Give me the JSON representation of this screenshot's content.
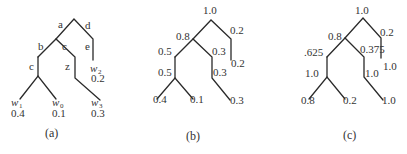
{
  "figure": {
    "panels": [
      {
        "caption": "(a)",
        "edge_labels": {
          "a": "a",
          "b": "b",
          "c_left": "c",
          "c_right": "c",
          "d": "d",
          "e": "e",
          "z": "z"
        },
        "leaves": [
          {
            "symbol": "w",
            "sub": "1",
            "value": "0.4"
          },
          {
            "symbol": "w",
            "sub": "0",
            "value": "0.1"
          },
          {
            "symbol": "w",
            "sub": "3",
            "value": "0.3"
          },
          {
            "symbol": "w",
            "sub": "2",
            "value": "0.2"
          }
        ]
      },
      {
        "caption": "(b)",
        "root": "1.0",
        "left_top": "0.8",
        "right_top": "0.2",
        "ll": "0.5",
        "lr": "0.3",
        "ll2": "0.5",
        "lr2": "0.3",
        "r2": "0.2",
        "leaves": [
          "0.4",
          "0.1",
          "0.3"
        ]
      },
      {
        "caption": "(c)",
        "root": "1.0",
        "left_top": "0.8",
        "right_top": "0.2",
        "ll": ".625",
        "lr": "0.375",
        "ll2": "1.0",
        "lr2": "1.0",
        "r2": "1.0",
        "leaves": [
          "0.8",
          "0.2",
          "1.0"
        ]
      }
    ]
  }
}
